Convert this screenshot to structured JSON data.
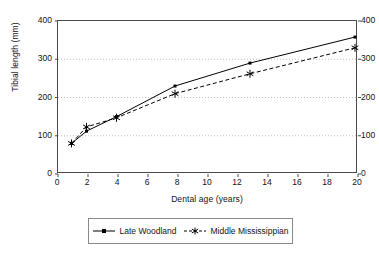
{
  "chart_data": {
    "type": "line",
    "title": "",
    "xlabel": "Dental age (years)",
    "ylabel": "Tibial length (mm)",
    "ylabel_right": "Tibial length (mm)",
    "xlim": [
      0,
      20
    ],
    "ylim": [
      0,
      400
    ],
    "ylim_right": [
      0,
      400
    ],
    "xticks": [
      0,
      2,
      4,
      6,
      8,
      10,
      12,
      14,
      16,
      18,
      20
    ],
    "yticks": [
      0,
      100,
      200,
      300,
      400
    ],
    "yticks_right": [
      0,
      100,
      200,
      300,
      400
    ],
    "yticks_right_labels": [
      "0",
      "100",
      "200",
      "300",
      "400"
    ],
    "grid": "horizontal-dotted",
    "legend_position": "bottom",
    "series": [
      {
        "name": "Late Woodland",
        "line_style": "solid",
        "marker": "small-square",
        "color": "#000000",
        "points": [
          {
            "x": 0.9,
            "y": 80
          },
          {
            "x": 1.9,
            "y": 112
          },
          {
            "x": 3.9,
            "y": 150
          },
          {
            "x": 7.8,
            "y": 230
          },
          {
            "x": 12.8,
            "y": 290
          },
          {
            "x": 19.8,
            "y": 358
          }
        ]
      },
      {
        "name": "Middle Mississippian",
        "line_style": "dashed",
        "marker": "asterisk",
        "color": "#000000",
        "points": [
          {
            "x": 0.9,
            "y": 80
          },
          {
            "x": 1.9,
            "y": 123
          },
          {
            "x": 3.9,
            "y": 147
          },
          {
            "x": 7.8,
            "y": 210
          },
          {
            "x": 12.8,
            "y": 262
          },
          {
            "x": 19.8,
            "y": 330
          }
        ]
      }
    ]
  },
  "axes": {
    "ylabel_left": "Tibial length (mm)",
    "xlabel": "Dental age (years)",
    "ytick_labels_left": [
      "400",
      "300",
      "200",
      "100",
      "0"
    ],
    "ytick_labels_right": [
      "400",
      "300",
      "200",
      "100",
      "0"
    ],
    "xtick_labels": [
      "0",
      "2",
      "4",
      "6",
      "8",
      "10",
      "12",
      "14",
      "16",
      "18",
      "20"
    ]
  },
  "legend": {
    "entries": [
      {
        "label": "Late Woodland",
        "marker": "small-square",
        "style": "solid"
      },
      {
        "label": "Middle Mississippian",
        "marker": "asterisk",
        "style": "dashed"
      }
    ]
  },
  "colors": {
    "ink": "#000000",
    "axis": "#4a4a4a",
    "grid": "#b0b0b0"
  }
}
